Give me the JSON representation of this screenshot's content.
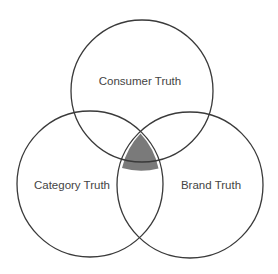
{
  "diagram": {
    "type": "venn",
    "sets": [
      {
        "id": "consumer",
        "label": "Consumer Truth",
        "cx": 142,
        "cy": 91,
        "r": 71,
        "label_x": 140,
        "label_y": 81
      },
      {
        "id": "category",
        "label": "Category Truth",
        "cx": 90,
        "cy": 184,
        "r": 73,
        "label_x": 72,
        "label_y": 185
      },
      {
        "id": "brand",
        "label": "Brand Truth",
        "cx": 190,
        "cy": 185,
        "r": 73,
        "label_x": 211,
        "label_y": 185
      }
    ],
    "highlighted_intersection": {
      "sets": [
        "consumer",
        "category",
        "brand"
      ],
      "fill": "#7a7a7a"
    },
    "stroke_color": "#3a3a3a",
    "text_color": "#444444",
    "background": "#ffffff"
  }
}
